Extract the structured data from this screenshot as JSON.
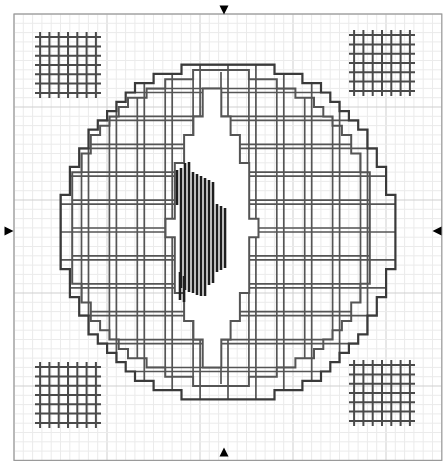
{
  "document": {
    "kind": "needlework-pattern-chart",
    "title": "Blackwork / Cross-Stitch Pattern Chart",
    "width_px": 444,
    "height_px": 462,
    "background_color": "#ffffff",
    "border_color": "#9a9a9a"
  },
  "grid": {
    "cell_px": 9.3,
    "origin_x": 14,
    "origin_y": 14,
    "cols": 46,
    "rows": 48,
    "minor_color": "#ebebeb",
    "major_color": "#cfcfcf",
    "major_every": 10,
    "visible": true
  },
  "palette": {
    "outline_dark": "#3a3a3a",
    "outline_mid": "#707070",
    "fill_stitch": "#555555",
    "straight_stitch": "#1e1e1e",
    "lattice": "#4a4a4a",
    "marker": "#000000"
  },
  "markers": [
    {
      "name": "center-marker-top",
      "glyph": "triangle-down",
      "x": 224,
      "y": 10,
      "size": 9
    },
    {
      "name": "center-marker-bottom",
      "glyph": "triangle-up",
      "x": 224,
      "y": 452,
      "size": 9
    },
    {
      "name": "center-marker-left",
      "glyph": "triangle-right",
      "x": 9,
      "y": 231,
      "size": 9
    },
    {
      "name": "center-marker-right",
      "glyph": "triangle-left",
      "x": 437,
      "y": 231,
      "size": 9
    }
  ],
  "corner_motifs": [
    {
      "name": "lattice-top-left",
      "cx": 68,
      "cy": 65,
      "cells": 6,
      "step": 9.3
    },
    {
      "name": "lattice-top-right",
      "cx": 382,
      "cy": 63,
      "cells": 6,
      "step": 9.3
    },
    {
      "name": "lattice-bottom-left",
      "cx": 68,
      "cy": 395,
      "cells": 6,
      "step": 9.3
    },
    {
      "name": "lattice-bottom-right",
      "cx": 382,
      "cy": 393,
      "cells": 6,
      "step": 9.3
    }
  ],
  "chart_data": {
    "type": "table",
    "legend": [
      {
        "symbol": "stepped-outline-dark",
        "label": "Backstitch outline (dark)",
        "color": "#3a3a3a"
      },
      {
        "symbol": "stepped-outline-mid",
        "label": "Backstitch outline (mid)",
        "color": "#707070"
      },
      {
        "symbol": "filled-grid",
        "label": "Filled stitch grid",
        "color": "#555555"
      },
      {
        "symbol": "vertical-lines",
        "label": "Vertical straight stitch",
        "color": "#1e1e1e"
      },
      {
        "symbol": "lattice",
        "label": "Open lattice filling",
        "color": "#4a4a4a"
      },
      {
        "symbol": "triangle",
        "label": "Centre marker",
        "color": "#000000"
      }
    ],
    "shapes": {
      "outer_circle": {
        "name": "outer-circle",
        "cx": 228,
        "cy": 232,
        "r_px": 166,
        "step_px": 9.3,
        "stroke": "#3a3a3a",
        "inner_grid_step": 27.9,
        "inner_grid_color": "#555555"
      },
      "inner_circle": {
        "name": "inner-circle",
        "cx": 221,
        "cy": 228,
        "r_px": 152,
        "step_px": 9.3,
        "stroke": "#555555"
      },
      "eye": {
        "name": "eye-leaf-shape",
        "cx": 212,
        "cy": 228,
        "half_width_px": 42,
        "half_height_px": 135,
        "stroke": "#555555"
      },
      "vertical_stitch_columns": [
        {
          "x": 177,
          "y1": 170,
          "y2": 205
        },
        {
          "x": 181,
          "y1": 168,
          "y2": 288
        },
        {
          "x": 185,
          "y1": 163,
          "y2": 290
        },
        {
          "x": 189,
          "y1": 162,
          "y2": 292
        },
        {
          "x": 193,
          "y1": 172,
          "y2": 293
        },
        {
          "x": 197,
          "y1": 174,
          "y2": 295
        },
        {
          "x": 201,
          "y1": 176,
          "y2": 296
        },
        {
          "x": 205,
          "y1": 178,
          "y2": 296
        },
        {
          "x": 209,
          "y1": 180,
          "y2": 285
        },
        {
          "x": 213,
          "y1": 182,
          "y2": 283
        },
        {
          "x": 217,
          "y1": 204,
          "y2": 272
        },
        {
          "x": 221,
          "y1": 206,
          "y2": 270
        },
        {
          "x": 225,
          "y1": 208,
          "y2": 268
        },
        {
          "x": 180,
          "y1": 272,
          "y2": 300
        },
        {
          "x": 184,
          "y1": 276,
          "y2": 302
        }
      ]
    }
  }
}
